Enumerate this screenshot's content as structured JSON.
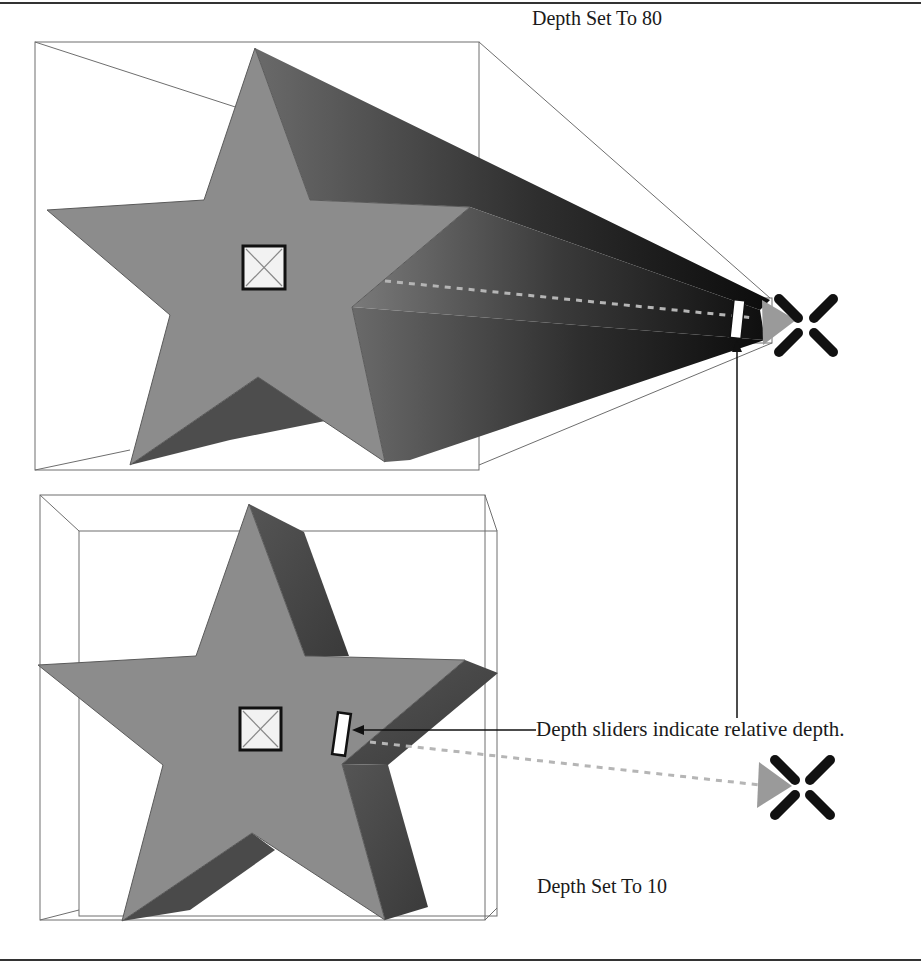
{
  "figure": {
    "top_panel": {
      "label": "Depth Set To 80",
      "depth": 80
    },
    "bottom_panel": {
      "label": "Depth Set To 10",
      "depth": 10
    },
    "callout": {
      "label": "Depth sliders indicate relative depth."
    },
    "colors": {
      "star_face": "#8c8c8c",
      "star_side": "#4a4a4a",
      "extrusion_dark": "#141414",
      "box_line": "#6e6e6e",
      "vanishing_point_x": "#111111",
      "vanishing_arrow": "#9a9a9a",
      "dotted_line": "#b5b5b5",
      "frame_rule": "#333333"
    },
    "icons": {
      "center_handle": "square-with-x-icon",
      "depth_slider": "rectangular-slider-icon",
      "vanishing_point": "x-cross-icon",
      "direction_arrow": "triangle-arrow-icon"
    }
  }
}
